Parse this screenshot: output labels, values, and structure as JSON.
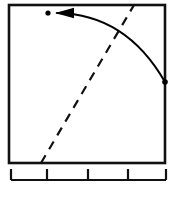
{
  "figure": {
    "title": "",
    "width": 178,
    "height": 206,
    "background_color": "#ffffff"
  },
  "plot_frame": {
    "name": "plot-box",
    "x_left": 9,
    "x_right": 165,
    "y_top": 5,
    "y_bottom": 163,
    "border_color": "#111111",
    "border_width": 2.6,
    "fill_color": "#ffffff"
  },
  "gridlines": {
    "color": "#c9c9c9",
    "vertical_x": [
      48,
      88
    ],
    "horizontal_y": [
      82
    ]
  },
  "markers": [
    {
      "name": "target-point",
      "label": "",
      "x": 48,
      "y": 13,
      "radius": 2.6,
      "color": "#000000"
    },
    {
      "name": "origin-point",
      "label": "",
      "x": 165,
      "y": 82,
      "radius": 2.8,
      "color": "#000000"
    }
  ],
  "curve": {
    "name": "trajectory-arrow",
    "color": "#000000",
    "stroke_width": 2.0,
    "start": [
      165,
      82
    ],
    "control": [
      126,
      14
    ],
    "end": [
      57,
      13
    ],
    "arrowhead": {
      "tip_x": 55,
      "tip_y": 13,
      "back_x": 74,
      "half_height": 5.2,
      "direction": "left",
      "color": "#000000"
    }
  },
  "dashed_line": {
    "name": "reference-line",
    "color": "#111111",
    "stroke_width": 2.2,
    "dash_pattern": "9 7",
    "start": [
      41,
      163
    ],
    "end": [
      134,
      5
    ]
  },
  "axis": {
    "name": "bottom-axis",
    "color": "#111111",
    "rule_y": 180,
    "rule_x_start": 11,
    "rule_x_end": 166,
    "rule_width": 2.2,
    "tick_width": 2.2,
    "tick_height": 11,
    "tick_positions": [
      11,
      47,
      88,
      128,
      166
    ],
    "tick_labels": [
      "",
      "",
      "",
      "",
      ""
    ]
  },
  "chart_data": {
    "type": "line",
    "title": "",
    "xlabel": "",
    "ylabel": "",
    "grid": true,
    "legend_position": "none",
    "xlim": [
      0,
      4
    ],
    "ylim": [
      0,
      4
    ],
    "xticks": [
      0,
      1,
      2,
      3,
      4
    ],
    "xticklabels": [
      "",
      "",
      "",
      "",
      ""
    ],
    "yticks": [],
    "yticklabels": [],
    "annotations": [
      {
        "kind": "point",
        "name": "target-point",
        "x": 1.0,
        "y": 3.8
      },
      {
        "kind": "point",
        "name": "origin-point",
        "x": 4.0,
        "y": 2.05
      },
      {
        "kind": "arrow",
        "name": "trajectory-arrow",
        "from": [
          4.0,
          2.05
        ],
        "to": [
          1.18,
          3.8
        ],
        "style": "curved",
        "arrowhead": "solid-triangle"
      },
      {
        "kind": "line",
        "name": "reference-line",
        "style": "dashed",
        "from": [
          0.82,
          0.0
        ],
        "to": [
          3.21,
          4.0
        ]
      }
    ],
    "series": [
      {
        "name": "trajectory",
        "style": "solid-curve",
        "x": [
          4.0,
          3.6,
          3.2,
          2.8,
          2.4,
          2.0,
          1.6,
          1.18
        ],
        "y": [
          2.05,
          2.74,
          3.17,
          3.45,
          3.63,
          3.73,
          3.78,
          3.8
        ]
      },
      {
        "name": "reference",
        "style": "dashed-line",
        "x": [
          0.82,
          3.21
        ],
        "y": [
          0.0,
          4.0
        ]
      }
    ]
  }
}
